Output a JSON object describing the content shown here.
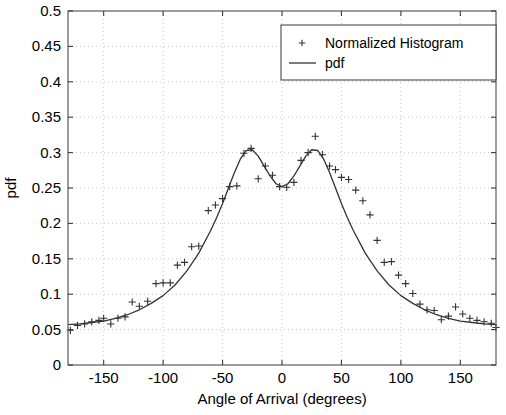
{
  "chart_data": {
    "type": "line",
    "title": "",
    "xlabel": "Angle of Arrival (degrees)",
    "ylabel": "pdf",
    "xlim": [
      -180,
      180
    ],
    "ylim": [
      0,
      0.5
    ],
    "grid": true,
    "xticks": [
      -150,
      -100,
      -50,
      0,
      50,
      100,
      150
    ],
    "xticklabels": [
      "-150",
      "-100",
      "-50",
      "0",
      "50",
      "100",
      "150"
    ],
    "yticks": [
      0,
      0.05,
      0.1,
      0.15,
      0.2,
      0.25,
      0.3,
      0.35,
      0.4,
      0.45,
      0.5
    ],
    "yticklabels": [
      "0",
      "0.05",
      "0.1",
      "0.15",
      "0.2",
      "0.25",
      "0.3",
      "0.35",
      "0.4",
      "0.45",
      "0.5"
    ],
    "legend": {
      "position": "upper right",
      "entries": [
        {
          "name": "Normalized Histogram",
          "marker": "+",
          "style": "scatter",
          "color": "#333333"
        },
        {
          "name": "pdf",
          "marker": "line",
          "style": "line",
          "color": "#333333"
        }
      ]
    },
    "series": [
      {
        "name": "pdf",
        "style": "line",
        "color": "#333333",
        "x": [
          -180,
          -170,
          -160,
          -150,
          -140,
          -130,
          -120,
          -110,
          -100,
          -90,
          -80,
          -70,
          -60,
          -55,
          -50,
          -45,
          -40,
          -35,
          -30,
          -25,
          -20,
          -15,
          -10,
          -5,
          0,
          5,
          10,
          15,
          20,
          25,
          30,
          35,
          40,
          45,
          50,
          55,
          60,
          70,
          80,
          90,
          100,
          110,
          120,
          130,
          140,
          150,
          160,
          170,
          180
        ],
        "y": [
          0.057,
          0.058,
          0.06,
          0.062,
          0.066,
          0.071,
          0.078,
          0.087,
          0.098,
          0.113,
          0.133,
          0.158,
          0.19,
          0.208,
          0.228,
          0.25,
          0.272,
          0.291,
          0.303,
          0.304,
          0.295,
          0.281,
          0.267,
          0.256,
          0.252,
          0.256,
          0.267,
          0.281,
          0.295,
          0.304,
          0.303,
          0.291,
          0.272,
          0.25,
          0.228,
          0.208,
          0.19,
          0.158,
          0.133,
          0.113,
          0.098,
          0.087,
          0.078,
          0.071,
          0.066,
          0.062,
          0.06,
          0.058,
          0.057
        ]
      },
      {
        "name": "Normalized Histogram",
        "style": "scatter",
        "marker": "+",
        "color": "#333333",
        "x": [
          -178,
          -172,
          -166,
          -160,
          -154,
          -150,
          -144,
          -138,
          -132,
          -126,
          -120,
          -113,
          -106,
          -100,
          -94,
          -88,
          -82,
          -76,
          -70,
          -62,
          -56,
          -50,
          -44,
          -38,
          -32,
          -26,
          -20,
          -14,
          -8,
          -2,
          4,
          10,
          16,
          22,
          28,
          34,
          40,
          45,
          50,
          56,
          62,
          68,
          74,
          80,
          86,
          92,
          98,
          104,
          110,
          116,
          122,
          128,
          134,
          140,
          146,
          152,
          158,
          164,
          170,
          176,
          180
        ],
        "y": [
          0.049,
          0.056,
          0.058,
          0.061,
          0.063,
          0.066,
          0.058,
          0.066,
          0.068,
          0.089,
          0.083,
          0.09,
          0.115,
          0.116,
          0.116,
          0.141,
          0.145,
          0.167,
          0.168,
          0.218,
          0.226,
          0.235,
          0.252,
          0.253,
          0.299,
          0.306,
          0.263,
          0.281,
          0.268,
          0.252,
          0.251,
          0.258,
          0.289,
          0.3,
          0.323,
          0.297,
          0.281,
          0.276,
          0.265,
          0.262,
          0.247,
          0.232,
          0.212,
          0.176,
          0.145,
          0.146,
          0.127,
          0.115,
          0.101,
          0.086,
          0.078,
          0.077,
          0.064,
          0.069,
          0.082,
          0.072,
          0.066,
          0.063,
          0.061,
          0.059,
          0.053
        ]
      }
    ]
  }
}
